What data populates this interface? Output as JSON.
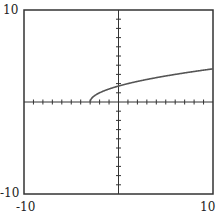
{
  "chart_data": {
    "type": "line",
    "title": "",
    "xlabel": "",
    "ylabel": "",
    "xlim": [
      -10,
      10
    ],
    "ylim": [
      -10,
      10
    ],
    "grid": false,
    "function": "y = sqrt(x + 3)",
    "series": [
      {
        "name": "f(x)",
        "x": [
          -3,
          -2,
          -1,
          0,
          2,
          4,
          6,
          8,
          10
        ],
        "values": [
          0,
          1,
          1.41,
          1.73,
          2.24,
          2.65,
          3,
          3.32,
          3.61
        ]
      }
    ],
    "tick_labels": {
      "y_max": "10",
      "y_min": "-10",
      "x_min": "-10",
      "x_max": "10"
    },
    "colors": {
      "curve": "#555555",
      "axis": "#333333"
    }
  }
}
